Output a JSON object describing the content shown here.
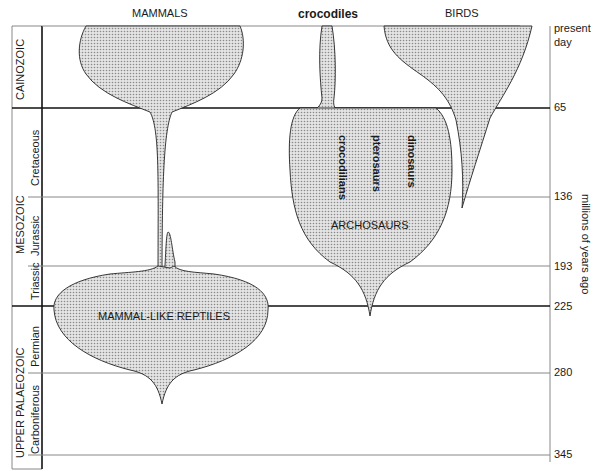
{
  "diagram": {
    "column_headers": {
      "mammals": "MAMMALS",
      "crocodiles": "crocodiles",
      "birds": "BIRDS"
    },
    "time_scale": {
      "axis_label": "millions of years ago",
      "ticks": [
        {
          "label": "present day",
          "y": 26
        },
        {
          "label": "65",
          "y": 108
        },
        {
          "label": "136",
          "y": 197
        },
        {
          "label": "193",
          "y": 266
        },
        {
          "label": "225",
          "y": 306
        },
        {
          "label": "280",
          "y": 373
        },
        {
          "label": "345",
          "y": 455
        }
      ],
      "present_line1": "present",
      "present_line2": "day"
    },
    "eras": [
      {
        "name": "CAINOZOIC"
      },
      {
        "name": "MESOZOIC"
      },
      {
        "name": "UPPER PALAEOZOIC"
      }
    ],
    "periods": [
      {
        "name": "Cretaceous"
      },
      {
        "name": "Jurassic"
      },
      {
        "name": "Triassic"
      },
      {
        "name": "Permian"
      },
      {
        "name": "Carboniferous"
      }
    ],
    "group_labels": {
      "archosaurs": "ARCHOSAURS",
      "mammal_like_reptiles": "MAMMAL-LIKE REPTILES",
      "crocodilians": "crocodilians",
      "pterosaurs": "pterosaurs",
      "dinosaurs": "dinosaurs"
    },
    "colors": {
      "line": "#1a1a1a",
      "thin_line": "#888888",
      "fill": "#c8c8c8"
    }
  }
}
